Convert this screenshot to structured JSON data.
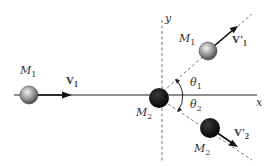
{
  "diagram": {
    "type": "elastic-collision-2d",
    "axes": {
      "x_label": "x",
      "y_label": "y"
    },
    "bodies": [
      {
        "id": "M1_initial",
        "label": "M",
        "sub": "1",
        "color": "#8a8a8a",
        "velocity_label": "V",
        "velocity_sub": "1"
      },
      {
        "id": "M2_initial",
        "label": "M",
        "sub": "2",
        "color": "#111111"
      },
      {
        "id": "M1_final",
        "label": "M",
        "sub": "1",
        "color": "#8a8a8a",
        "velocity_label": "V'",
        "velocity_sub": "1"
      },
      {
        "id": "M2_final",
        "label": "M",
        "sub": "2",
        "color": "#111111",
        "velocity_label": "V'",
        "velocity_sub": "2"
      }
    ],
    "angles": [
      {
        "label": "θ",
        "sub": "1"
      },
      {
        "label": "θ",
        "sub": "2"
      }
    ],
    "colors": {
      "line": "#555555",
      "dashed": "#777777",
      "arrow": "#111111"
    }
  }
}
